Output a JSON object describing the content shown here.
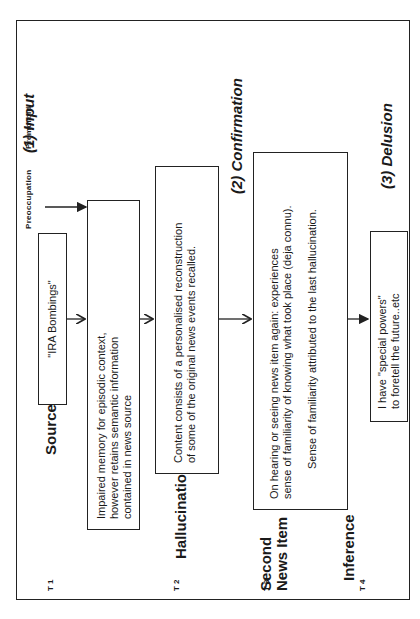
{
  "diagram": {
    "premorbid_label": "Premorbid",
    "preoccupation_label": "Preoccupation",
    "stages": [
      {
        "label": "(1)  Input"
      },
      {
        "label": "(2)  Confirmation"
      },
      {
        "label": "(3)  Delusion"
      }
    ],
    "headers": {
      "source_news_item": "Source News Item",
      "amnesia": "Amnesia",
      "hallucination": "Hallucination",
      "second_news_item_line1": "Second",
      "second_news_item_line2": "News Item",
      "inference": "Inference"
    },
    "time_markers": [
      "T 1",
      "T 2",
      "T 3",
      "T 4"
    ],
    "boxes": {
      "ira": "\"IRA Bombings\"",
      "impaired": [
        "Impaired memory for episodic context,",
        "however retains semantic information",
        "contained in news source"
      ],
      "content": [
        "Content consists of a personalised reconstruction",
        "of some of the original news events recalled."
      ],
      "second": [
        "On hearing or seeing news item again:  experiences",
        "sense of familiarity of knowing what took place (deja connu).",
        "Sense of familiarity attributed to the last hallucination."
      ],
      "delusion": [
        "I  have \"special powers\"",
        "to foretell the future..etc"
      ]
    }
  }
}
